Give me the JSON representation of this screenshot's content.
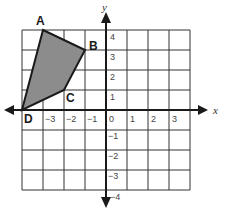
{
  "diagram": {
    "type": "coordinate-plane",
    "axes": {
      "x_label": "x",
      "y_label": "y",
      "x_range": [
        -4,
        4
      ],
      "y_range": [
        -4,
        4
      ]
    },
    "x_ticks": [
      "−3",
      "−2",
      "−1",
      "0",
      "1",
      "2",
      "3"
    ],
    "y_ticks_positive": [
      "4",
      "3",
      "2",
      "1"
    ],
    "y_ticks_negative": [
      "−1",
      "−2",
      "−3",
      "−4"
    ],
    "polygon": {
      "fill": "#8c8c8c",
      "stroke": "#1a1a1a",
      "vertices": [
        {
          "label": "A",
          "x": -3,
          "y": 4
        },
        {
          "label": "B",
          "x": -1,
          "y": 3
        },
        {
          "label": "C",
          "x": -2,
          "y": 1
        },
        {
          "label": "D",
          "x": -4,
          "y": 0
        }
      ]
    }
  }
}
